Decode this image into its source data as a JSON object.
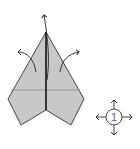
{
  "diagram": {
    "paper_color": "#c8c8c8",
    "line_color": "#333333",
    "symbol": {
      "label": "1",
      "meaning": "turn-over / rotate indicator with arrows in four directions"
    },
    "arrows": [
      "up-from-apex",
      "left-curve",
      "right-curve"
    ]
  }
}
